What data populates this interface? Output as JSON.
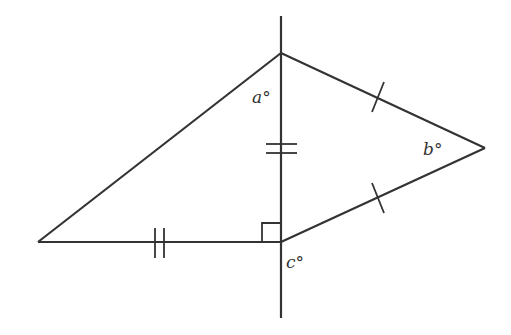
{
  "diagram": {
    "stroke_color": "#333333",
    "background": "#ffffff",
    "points": {
      "top": [
        281,
        53
      ],
      "bottom": [
        281,
        242
      ],
      "left": [
        38,
        242
      ],
      "right": [
        485,
        148
      ]
    },
    "vertical_line": {
      "x": 281,
      "y1": 16,
      "y2": 318
    },
    "labels": {
      "a": "a°",
      "b": "b°",
      "c": "c°"
    },
    "marks": {
      "right_angle": "at bottom vertex between left leg and vertical segment",
      "double_tick_vertical": "on shared vertical segment",
      "double_tick_horizontal": "on bottom horizontal leg",
      "single_tick_upper_right": "on top-to-right side",
      "single_tick_lower_right": "on bottom-to-right side"
    }
  }
}
